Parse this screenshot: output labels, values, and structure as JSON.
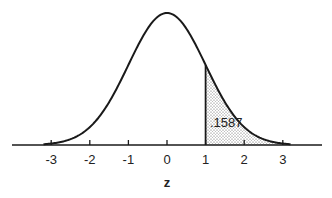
{
  "chart_data": {
    "type": "area",
    "title": "",
    "xlabel": "z",
    "ylabel": "",
    "x_ticks": [
      -3,
      -2,
      -1,
      0,
      1,
      2,
      3
    ],
    "x_tick_labels": [
      "-3",
      "-2",
      "-1",
      "0",
      "1",
      "2",
      "3"
    ],
    "xlim": [
      -3.2,
      3.2
    ],
    "grid": false,
    "legend": null,
    "curve": {
      "distribution": "standard normal",
      "mean": 0,
      "sd": 1
    },
    "shaded_region": {
      "from": 1,
      "to": 3.2,
      "pattern": "stippled",
      "area_label": ".1587"
    }
  },
  "labels": {
    "x_axis": "z",
    "area": ".1587",
    "ticks": [
      "-3",
      "-2",
      "-1",
      "0",
      "1",
      "2",
      "3"
    ]
  },
  "style": {
    "line_color": "#1a1a1a",
    "dot_color": "#555555",
    "background": "#ffffff"
  }
}
